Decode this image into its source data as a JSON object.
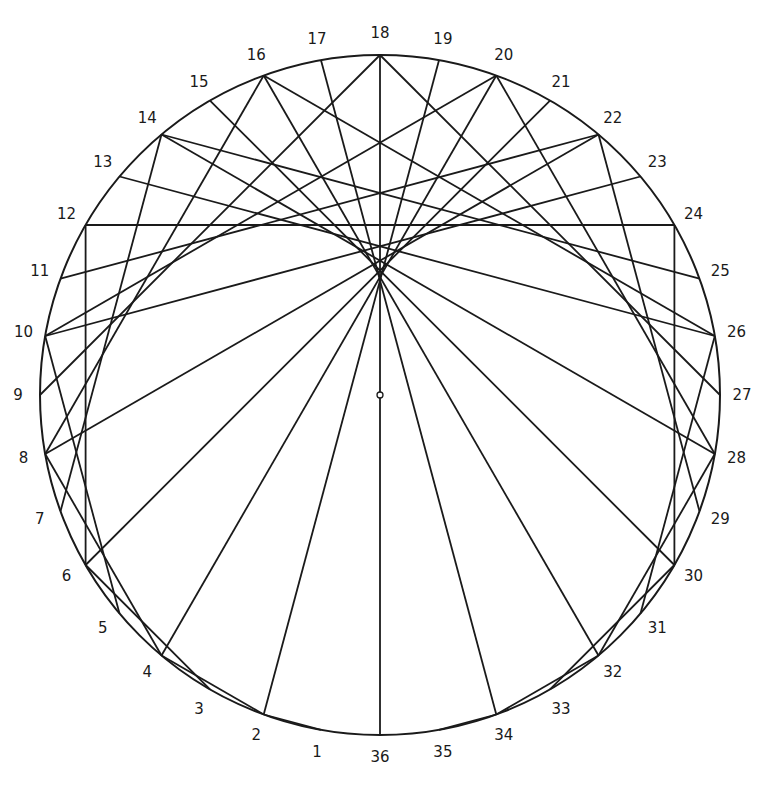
{
  "diagram": {
    "type": "circle-chord-envelope",
    "circle": {
      "cx": 380,
      "cy": 395,
      "r": 340
    },
    "point_count": 36,
    "multiplier": 2,
    "center_marker": {
      "x": 380,
      "y": 395,
      "r": 3
    },
    "stroke_color": "#1a1a1a",
    "labels": [
      "1",
      "2",
      "3",
      "4",
      "5",
      "6",
      "7",
      "8",
      "9",
      "10",
      "11",
      "12",
      "13",
      "14",
      "15",
      "16",
      "17",
      "18",
      "19",
      "20",
      "21",
      "22",
      "23",
      "24",
      "25",
      "26",
      "27",
      "28",
      "29",
      "30",
      "31",
      "32",
      "33",
      "34",
      "35",
      "36"
    ],
    "label_offset": 22,
    "chords": [
      [
        1,
        2
      ],
      [
        2,
        4
      ],
      [
        3,
        6
      ],
      [
        4,
        8
      ],
      [
        5,
        10
      ],
      [
        6,
        12
      ],
      [
        7,
        14
      ],
      [
        8,
        16
      ],
      [
        9,
        18
      ],
      [
        10,
        20
      ],
      [
        11,
        22
      ],
      [
        12,
        24
      ],
      [
        13,
        26
      ],
      [
        14,
        28
      ],
      [
        15,
        30
      ],
      [
        16,
        32
      ],
      [
        17,
        34
      ],
      [
        18,
        36
      ],
      [
        19,
        2
      ],
      [
        20,
        4
      ],
      [
        21,
        6
      ],
      [
        22,
        8
      ],
      [
        23,
        10
      ],
      [
        24,
        12
      ],
      [
        25,
        14
      ],
      [
        26,
        16
      ],
      [
        27,
        18
      ],
      [
        28,
        20
      ],
      [
        29,
        22
      ],
      [
        30,
        24
      ],
      [
        31,
        26
      ],
      [
        32,
        28
      ],
      [
        33,
        30
      ],
      [
        34,
        32
      ],
      [
        35,
        34
      ]
    ]
  }
}
